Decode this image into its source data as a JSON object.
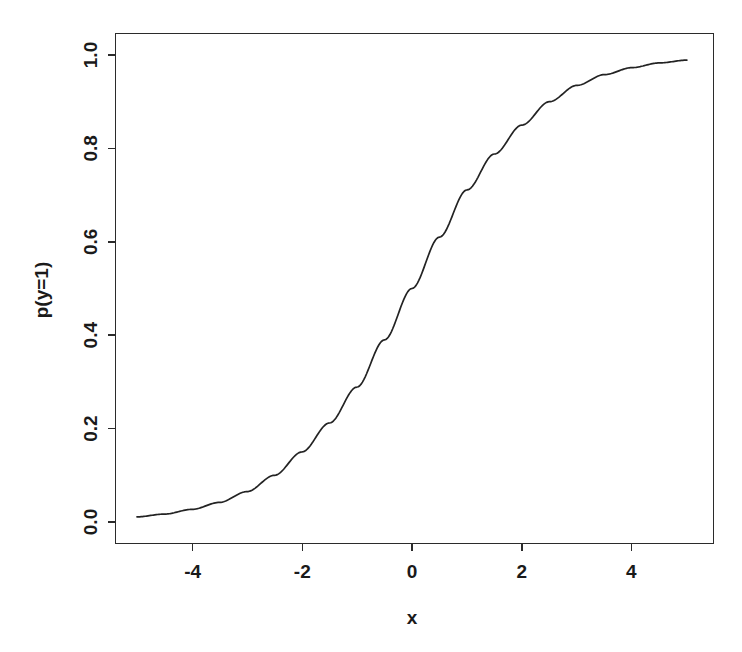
{
  "figure": {
    "background_color": "#ffffff",
    "line_color": "#232323",
    "axis_color": "#2b2b2b"
  },
  "chart_data": {
    "type": "line",
    "title": "",
    "subtitle": "",
    "xlabel": "x",
    "ylabel": "p(y=1)",
    "xlim": [
      -5,
      5
    ],
    "ylim": [
      0.0,
      1.0
    ],
    "grid": false,
    "legend": null,
    "x_ticks": [
      "-4",
      "-2",
      "0",
      "2",
      "4"
    ],
    "x_tick_values": [
      -4,
      -2,
      0,
      2,
      4
    ],
    "y_ticks": [
      "0.0",
      "0.2",
      "0.4",
      "0.6",
      "0.8",
      "1.0"
    ],
    "y_tick_values": [
      0.0,
      0.2,
      0.4,
      0.6,
      0.8,
      1.0
    ],
    "series": [
      {
        "name": "logistic",
        "x": [
          -5.0,
          -4.5,
          -4.0,
          -3.5,
          -3.0,
          -2.5,
          -2.0,
          -1.5,
          -1.0,
          -0.5,
          0.0,
          0.5,
          1.0,
          1.5,
          2.0,
          2.5,
          3.0,
          3.5,
          4.0,
          4.5,
          5.0
        ],
        "values": [
          0.011,
          0.017,
          0.027,
          0.042,
          0.065,
          0.1,
          0.15,
          0.212,
          0.289,
          0.39,
          0.5,
          0.61,
          0.711,
          0.788,
          0.85,
          0.9,
          0.935,
          0.958,
          0.973,
          0.983,
          0.989
        ]
      }
    ]
  },
  "labels": {
    "x_tick_0": "-4",
    "x_tick_1": "-2",
    "x_tick_2": "0",
    "x_tick_3": "2",
    "x_tick_4": "4",
    "y_tick_0": "0.0",
    "y_tick_1": "0.2",
    "y_tick_2": "0.4",
    "y_tick_3": "0.6",
    "y_tick_4": "0.8",
    "y_tick_5": "1.0",
    "x_axis_title": "x",
    "y_axis_title": "p(y=1)"
  }
}
